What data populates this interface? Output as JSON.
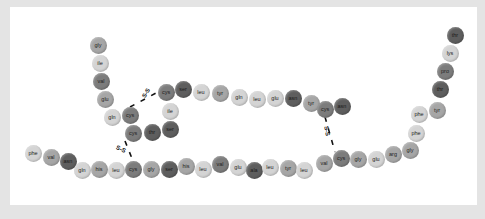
{
  "diagram": {
    "title": "",
    "palette": {
      "light": "#d4d4d4",
      "mid": "#a6a6a6",
      "dark": "#7c7c7c",
      "darker": "#5e5e5e",
      "frame": "#e4e4e4",
      "panel": "#ffffff"
    },
    "chain_a": [
      {
        "label": "gly",
        "x": 98,
        "y": 45,
        "shade": "mid"
      },
      {
        "label": "ile",
        "x": 100,
        "y": 63,
        "shade": "light"
      },
      {
        "label": "val",
        "x": 101,
        "y": 81,
        "shade": "dark"
      },
      {
        "label": "glu",
        "x": 105,
        "y": 99,
        "shade": "mid"
      },
      {
        "label": "gln",
        "x": 112,
        "y": 117,
        "shade": "light"
      },
      {
        "label": "cys",
        "x": 130,
        "y": 115,
        "shade": "dark"
      },
      {
        "label": "cys",
        "x": 133,
        "y": 133,
        "shade": "dark"
      },
      {
        "label": "thr",
        "x": 152,
        "y": 132,
        "shade": "darker"
      },
      {
        "label": "ser",
        "x": 170,
        "y": 129,
        "shade": "darker"
      },
      {
        "label": "ile",
        "x": 170,
        "y": 111,
        "shade": "light"
      },
      {
        "label": "cys",
        "x": 166,
        "y": 92,
        "shade": "dark"
      },
      {
        "label": "ser",
        "x": 183,
        "y": 89,
        "shade": "darker"
      },
      {
        "label": "leu",
        "x": 201,
        "y": 92,
        "shade": "light"
      },
      {
        "label": "tyr",
        "x": 220,
        "y": 93,
        "shade": "mid"
      },
      {
        "label": "gln",
        "x": 239,
        "y": 97,
        "shade": "light"
      },
      {
        "label": "leu",
        "x": 257,
        "y": 99,
        "shade": "light"
      },
      {
        "label": "glu",
        "x": 275,
        "y": 98,
        "shade": "light"
      },
      {
        "label": "asn",
        "x": 293,
        "y": 98,
        "shade": "darker"
      },
      {
        "label": "tyr",
        "x": 311,
        "y": 103,
        "shade": "mid"
      },
      {
        "label": "cys",
        "x": 325,
        "y": 109,
        "shade": "dark"
      },
      {
        "label": "asn",
        "x": 342,
        "y": 106,
        "shade": "darker"
      }
    ],
    "chain_b": [
      {
        "label": "phe",
        "x": 33,
        "y": 153,
        "shade": "light"
      },
      {
        "label": "val",
        "x": 51,
        "y": 157,
        "shade": "mid"
      },
      {
        "label": "asn",
        "x": 68,
        "y": 161,
        "shade": "darker"
      },
      {
        "label": "gln",
        "x": 82,
        "y": 170,
        "shade": "light"
      },
      {
        "label": "his",
        "x": 99,
        "y": 169,
        "shade": "mid"
      },
      {
        "label": "leu",
        "x": 116,
        "y": 170,
        "shade": "light"
      },
      {
        "label": "cys",
        "x": 133,
        "y": 169,
        "shade": "dark"
      },
      {
        "label": "gly",
        "x": 151,
        "y": 169,
        "shade": "mid"
      },
      {
        "label": "ser",
        "x": 169,
        "y": 169,
        "shade": "darker"
      },
      {
        "label": "his",
        "x": 186,
        "y": 166,
        "shade": "mid"
      },
      {
        "label": "leu",
        "x": 203,
        "y": 169,
        "shade": "light"
      },
      {
        "label": "val",
        "x": 220,
        "y": 164,
        "shade": "dark"
      },
      {
        "label": "glu",
        "x": 238,
        "y": 167,
        "shade": "light"
      },
      {
        "label": "ala",
        "x": 254,
        "y": 170,
        "shade": "darker"
      },
      {
        "label": "leu",
        "x": 270,
        "y": 167,
        "shade": "light"
      },
      {
        "label": "tyr",
        "x": 288,
        "y": 168,
        "shade": "mid"
      },
      {
        "label": "leu",
        "x": 304,
        "y": 170,
        "shade": "light"
      },
      {
        "label": "val",
        "x": 324,
        "y": 163,
        "shade": "mid"
      },
      {
        "label": "cys",
        "x": 341,
        "y": 158,
        "shade": "dark"
      },
      {
        "label": "gly",
        "x": 358,
        "y": 159,
        "shade": "mid"
      },
      {
        "label": "glu",
        "x": 376,
        "y": 159,
        "shade": "light"
      },
      {
        "label": "arg",
        "x": 393,
        "y": 154,
        "shade": "mid"
      },
      {
        "label": "gly",
        "x": 410,
        "y": 150,
        "shade": "mid"
      },
      {
        "label": "phe",
        "x": 416,
        "y": 133,
        "shade": "light"
      },
      {
        "label": "phe",
        "x": 419,
        "y": 114,
        "shade": "light"
      },
      {
        "label": "tyr",
        "x": 437,
        "y": 110,
        "shade": "mid"
      },
      {
        "label": "thr",
        "x": 440,
        "y": 89,
        "shade": "darker"
      },
      {
        "label": "pro",
        "x": 445,
        "y": 71,
        "shade": "dark"
      },
      {
        "label": "lys",
        "x": 450,
        "y": 53,
        "shade": "light"
      },
      {
        "label": "thr",
        "x": 455,
        "y": 35,
        "shade": "darker"
      }
    ],
    "disulfide_bonds": [
      {
        "label": "S-S",
        "from": [
          130,
          107
        ],
        "to": [
          158,
          92
        ],
        "text_x": 141,
        "text_y": 90,
        "rotate": -60
      },
      {
        "label": "S-S",
        "from": [
          125,
          141
        ],
        "to": [
          133,
          161
        ],
        "text_x": 116,
        "text_y": 146,
        "rotate": 25
      },
      {
        "label": "S-S",
        "from": [
          325,
          117
        ],
        "to": [
          335,
          152
        ],
        "text_x": 322,
        "text_y": 128,
        "rotate": 80
      }
    ]
  }
}
